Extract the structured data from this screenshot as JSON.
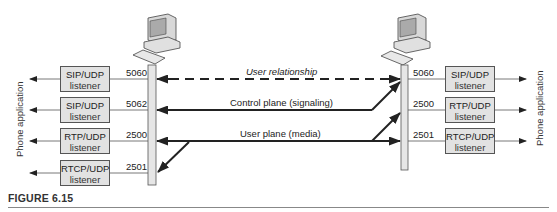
{
  "figure": {
    "caption": "FIGURE 6.15"
  },
  "left_host": {
    "app_label": "Phone application",
    "listeners": [
      {
        "line1": "SIP/UDP",
        "line2": "listener",
        "port": "5060"
      },
      {
        "line1": "SIP/UDP",
        "line2": "listener",
        "port": "5062"
      },
      {
        "line1": "RTP/UDP",
        "line2": "listener",
        "port": "2500"
      },
      {
        "line1": "RTCP/UDP",
        "line2": "listener",
        "port": "2501"
      }
    ]
  },
  "right_host": {
    "app_label": "Phone application",
    "listeners": [
      {
        "line1": "SIP/UDP",
        "line2": "listener",
        "port": "5060"
      },
      {
        "line1": "RTP/UDP",
        "line2": "listener",
        "port": "2500"
      },
      {
        "line1": "RTCP/UDP",
        "line2": "listener",
        "port": "2501"
      }
    ]
  },
  "messages": {
    "user_relationship": "User relationship",
    "control_plane": "Control plane (signaling)",
    "user_plane": "User plane (media)"
  },
  "colors": {
    "box_fill": "#e2e2e2",
    "line": "#222222",
    "bar_fill": "#e6e6e6"
  }
}
